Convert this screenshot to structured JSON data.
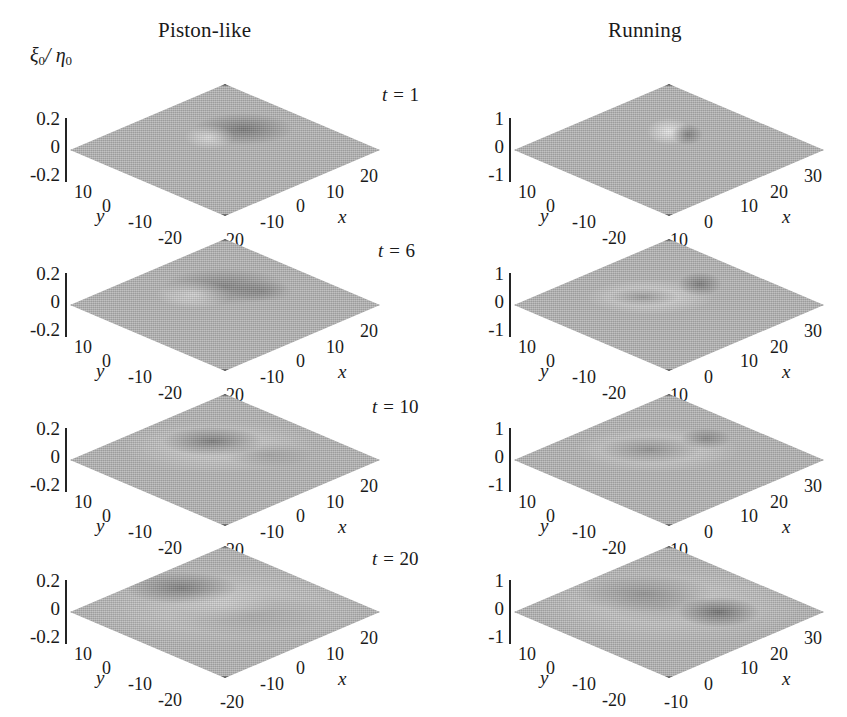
{
  "figure": {
    "zaxis_label": "ξ0/ η0",
    "zaxis_label_main": "ξ",
    "zaxis_label_sub1": "0",
    "zaxis_label_slash": "/ ",
    "zaxis_label_main2": "η",
    "zaxis_label_sub2": "0",
    "surface_color": "#b6b6b6",
    "edge_color": "#3a3a3a",
    "background": "#ffffff"
  },
  "columns": [
    {
      "label": "Piston-like"
    },
    {
      "label": "Running"
    }
  ],
  "rows": [
    {
      "time_prefix": "t =",
      "time_value": "1"
    },
    {
      "time_prefix": "t =",
      "time_value": "6"
    },
    {
      "time_prefix": "t =",
      "time_value": "10"
    },
    {
      "time_prefix": "t =",
      "time_value": "20"
    }
  ],
  "axes": {
    "piston": {
      "z_ticks": [
        "0.2",
        "0",
        "-0.2"
      ],
      "y_ticks": [
        "10",
        "0",
        "-10",
        "-20"
      ],
      "x_ticks": [
        "-20",
        "-10",
        "0",
        "10",
        "20"
      ],
      "x_name": "x",
      "y_name": "y"
    },
    "running": {
      "z_ticks": [
        "1",
        "0",
        "-1"
      ],
      "y_ticks": [
        "10",
        "0",
        "-10",
        "-20"
      ],
      "x_ticks": [
        "-10",
        "0",
        "10",
        "20",
        "30"
      ],
      "x_name": "x",
      "y_name": "y"
    }
  },
  "chart_data": {
    "type": "surface",
    "title": "",
    "zlabel": "ξ0/η0",
    "xlabel": "x",
    "ylabel": "y",
    "grid": false,
    "legend": "none",
    "panels": [
      {
        "column": "Piston-like",
        "row_time": 1,
        "zlim": [
          -0.2,
          0.2
        ],
        "xlim": [
          -20,
          20
        ],
        "ylim": [
          -20,
          10
        ],
        "z_ticks": [
          0.2,
          0,
          -0.2
        ],
        "x_ticks": [
          -20,
          -10,
          0,
          10,
          20
        ],
        "y_ticks": [
          10,
          0,
          -10,
          -20
        ],
        "feature": "single elongated plateau-like crest near centre, flat elsewhere",
        "peak_value": 0.2
      },
      {
        "column": "Piston-like",
        "row_time": 6,
        "zlim": [
          -0.2,
          0.2
        ],
        "xlim": [
          -20,
          20
        ],
        "ylim": [
          -20,
          10
        ],
        "z_ticks": [
          0.2,
          0,
          -0.2
        ],
        "x_ticks": [
          -20,
          -10,
          0,
          10,
          20
        ],
        "y_ticks": [
          10,
          0,
          -10,
          -20
        ],
        "feature": "broadened rounded mound with shallow depression forming behind it",
        "peak_value": 0.18
      },
      {
        "column": "Piston-like",
        "row_time": 10,
        "zlim": [
          -0.2,
          0.2
        ],
        "xlim": [
          -20,
          20
        ],
        "ylim": [
          -20,
          10
        ],
        "z_ticks": [
          0.2,
          0,
          -0.2
        ],
        "x_ticks": [
          -20,
          -10,
          0,
          10,
          20
        ],
        "y_ticks": [
          10,
          0,
          -10,
          -20
        ],
        "feature": "annular ring: central depression surrounded by raised rim",
        "peak_value": 0.12
      },
      {
        "column": "Piston-like",
        "row_time": 20,
        "zlim": [
          -0.2,
          0.2
        ],
        "xlim": [
          -20,
          20
        ],
        "ylim": [
          -20,
          10
        ],
        "z_ticks": [
          0.2,
          0,
          -0.2
        ],
        "x_ticks": [
          -20,
          -10,
          0,
          10,
          20
        ],
        "y_ticks": [
          10,
          0,
          -10,
          -20
        ],
        "feature": "large expanded annulus filling most of the domain, low amplitude",
        "peak_value": 0.08
      },
      {
        "column": "Running",
        "row_time": 1,
        "zlim": [
          -1,
          1
        ],
        "xlim": [
          -10,
          30
        ],
        "ylim": [
          -20,
          10
        ],
        "z_ticks": [
          1,
          0,
          -1
        ],
        "x_ticks": [
          -10,
          0,
          10,
          20,
          30
        ],
        "y_ticks": [
          10,
          0,
          -10,
          -20
        ],
        "feature": "sharp narrow peak near centre, flat elsewhere",
        "peak_value": 1.0
      },
      {
        "column": "Running",
        "row_time": 6,
        "zlim": [
          -1,
          1
        ],
        "xlim": [
          -10,
          30
        ],
        "ylim": [
          -20,
          10
        ],
        "z_ticks": [
          1,
          0,
          -1
        ],
        "x_ticks": [
          -10,
          0,
          10,
          20,
          30
        ],
        "y_ticks": [
          10,
          0,
          -10,
          -20
        ],
        "feature": "crest spreading outward with trailing depression, secondary peak downstream",
        "peak_value": 0.6
      },
      {
        "column": "Running",
        "row_time": 10,
        "zlim": [
          -1,
          1
        ],
        "xlim": [
          -10,
          30
        ],
        "ylim": [
          -20,
          10
        ],
        "z_ticks": [
          1,
          0,
          -1
        ],
        "x_ticks": [
          -10,
          0,
          10,
          20,
          30
        ],
        "y_ticks": [
          10,
          0,
          -10,
          -20
        ],
        "feature": "horseshoe / annular ring with depressed interior",
        "peak_value": 0.4
      },
      {
        "column": "Running",
        "row_time": 20,
        "zlim": [
          -1,
          1
        ],
        "xlim": [
          -10,
          30
        ],
        "ylim": [
          -20,
          10
        ],
        "z_ticks": [
          1,
          0,
          -1
        ],
        "x_ticks": [
          -10,
          0,
          10,
          20,
          30
        ],
        "y_ticks": [
          10,
          0,
          -10,
          -20
        ],
        "feature": "broad expanded ring occupying whole domain with deep trough on downstream side",
        "peak_value": 0.3
      }
    ]
  }
}
